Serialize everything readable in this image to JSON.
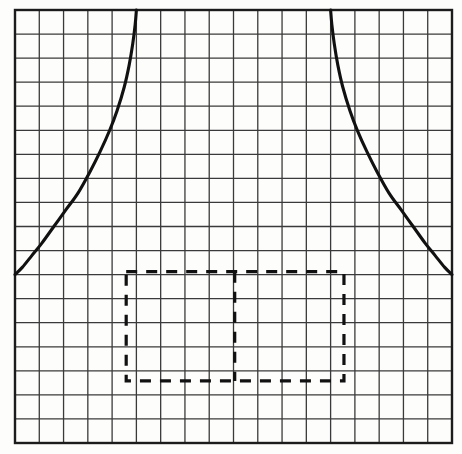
{
  "figure": {
    "title": "Graph paper plot of a symmetric curve with two vertical asymptotes and a dashed rectangular region",
    "background_color": "#fdfdfc",
    "grid_line_color": "#3a3a3a",
    "grid_border_color": "#1c1c1c",
    "curve_color": "#111111",
    "dashed_color": "#111111"
  },
  "grid": {
    "origin_x": 15,
    "origin_y": 10,
    "right_x": 452,
    "bottom_y": 443,
    "columns": 18,
    "rows": 18,
    "cell_width": 24.28,
    "cell_height": 24.06,
    "border_width": 2.4,
    "line_width": 1.3
  },
  "chart_data": {
    "type": "line",
    "title": "",
    "subtitle": "",
    "xlabel": "",
    "ylabel": "",
    "grid": true,
    "legend": false,
    "legend_position": "none",
    "xlim": [
      0,
      18
    ],
    "ylim": [
      0,
      18
    ],
    "xticks": [
      0,
      1,
      2,
      3,
      4,
      5,
      6,
      7,
      8,
      9,
      10,
      11,
      12,
      13,
      14,
      15,
      16,
      17,
      18
    ],
    "yticks": [
      0,
      1,
      2,
      3,
      4,
      5,
      6,
      7,
      8,
      9,
      10,
      11,
      12,
      13,
      14,
      15,
      16,
      17,
      18
    ],
    "xtick_labels": [],
    "ytick_labels": [],
    "annotations": [],
    "series": [
      {
        "name": "left-branch",
        "description": "Rising asymptotic branch; flat near left edge, sweeping steeply up to the vertical asymptote at x=5",
        "x": [
          0.0,
          0.3,
          0.7,
          1.1,
          1.6,
          2.1,
          2.6,
          3.1,
          3.5,
          3.9,
          4.2,
          4.5,
          4.7,
          4.85,
          4.95,
          5.0
        ],
        "y": [
          7.0,
          7.3,
          7.8,
          8.3,
          9.0,
          9.7,
          10.4,
          11.3,
          12.1,
          13.0,
          13.8,
          14.8,
          15.7,
          16.6,
          17.4,
          18.0
        ]
      },
      {
        "name": "right-branch",
        "description": "Falling asymptotic branch; mirror image of the left branch about x=11.5, dropping from the vertical asymptote at x=13 down to the right edge",
        "x": [
          13.0,
          13.05,
          13.15,
          13.3,
          13.5,
          13.8,
          14.1,
          14.5,
          14.9,
          15.4,
          15.9,
          16.4,
          16.9,
          17.3,
          17.7,
          18.0
        ],
        "y": [
          18.0,
          17.4,
          16.6,
          15.7,
          14.8,
          13.8,
          13.0,
          12.1,
          11.3,
          10.4,
          9.7,
          9.0,
          8.3,
          7.8,
          7.3,
          7.0
        ]
      }
    ],
    "asymptotes": [
      {
        "name": "left-asymptote",
        "type": "vertical",
        "x": 5.0
      },
      {
        "name": "right-asymptote",
        "type": "vertical",
        "x": 13.0
      }
    ],
    "shapes": [
      {
        "name": "dashed-region-rectangle",
        "type": "rectangle",
        "style": "dashed",
        "x0": 4.58,
        "x1": 13.55,
        "y0": 2.58,
        "y1": 7.12
      },
      {
        "name": "dashed-region-midline",
        "type": "vertical-line",
        "style": "dashed",
        "x": 9.05,
        "y0": 2.58,
        "y1": 7.12
      }
    ]
  },
  "dashed_region": {
    "left_px": 126,
    "right_px": 344,
    "top_px": 272,
    "bottom_px": 381,
    "midline_px": 235,
    "dash_pattern": "11 9",
    "stroke_width": 3.2
  },
  "curve_points_px": {
    "left_branch": "15,178 22,171 32,162 42,152 54,140 66,128 78,116 90,102 100,90 110,78 117,68 124,56 129,44 133,32 134.5,20 135,10",
    "right_branch": "330,10 331,20 333.5,32 337,44 342,56 349,68 356,78 366,90 376,102 388,116 400,128 412,140 424,152 434,162 444,171 452,178"
  }
}
